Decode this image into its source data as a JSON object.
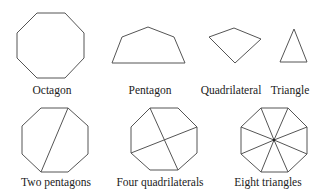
{
  "figure": {
    "top_row": [
      {
        "id": "octagon",
        "label": "Octagon",
        "cx": 52,
        "ly": 85
      },
      {
        "id": "pentagon",
        "label": "Pentagon",
        "cx": 150,
        "ly": 85
      },
      {
        "id": "quadrilateral",
        "label": "Quadrilateral",
        "cx": 231,
        "ly": 85
      },
      {
        "id": "triangle",
        "label": "Triangle",
        "cx": 290,
        "ly": 85
      }
    ],
    "bottom_row": [
      {
        "id": "two-pentagons",
        "label": "Two pentagons",
        "cx": 56,
        "ly": 177
      },
      {
        "id": "four-quadrilaterals",
        "label": "Four quadrilaterals",
        "cx": 160,
        "ly": 177
      },
      {
        "id": "eight-triangles",
        "label": "Eight triangles",
        "cx": 268,
        "ly": 177
      }
    ]
  },
  "colors": {
    "stroke": "#555555",
    "text": "#222222",
    "background": "#ffffff"
  }
}
